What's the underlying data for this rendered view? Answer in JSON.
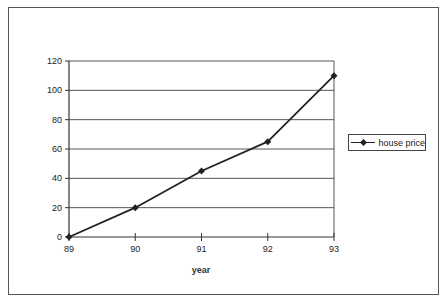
{
  "chart_data": {
    "type": "line",
    "title": "",
    "xlabel": "year",
    "ylabel": "",
    "categories": [
      "89",
      "90",
      "91",
      "92",
      "93"
    ],
    "series": [
      {
        "name": "house price",
        "values": [
          0,
          20,
          45,
          65,
          110
        ],
        "marker": "diamond",
        "color": "#222222"
      }
    ],
    "y_ticks": [
      0,
      20,
      40,
      60,
      80,
      100,
      120
    ],
    "ylim": [
      0,
      120
    ],
    "grid": {
      "horizontal": true,
      "vertical": false
    },
    "legend_position": "right"
  },
  "legend": {
    "label": "house price"
  },
  "axes": {
    "x_title": "year",
    "x_ticks": [
      "89",
      "90",
      "91",
      "92",
      "93"
    ],
    "y_ticks": [
      "0",
      "20",
      "40",
      "60",
      "80",
      "100",
      "120"
    ]
  }
}
